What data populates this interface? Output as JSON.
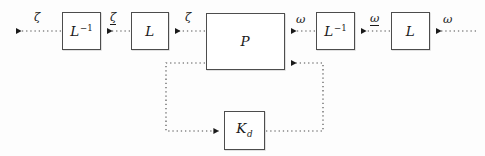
{
  "diagram": {
    "type": "control-block-diagram",
    "background_color": "#fdfdfd",
    "line_color": "#4d4d4d",
    "line_style": "dotted",
    "blocks": [
      {
        "id": "l-inv-left",
        "label_base": "L",
        "label_sup": "−1",
        "label_sub": "",
        "x": 62,
        "y": 12,
        "w": 39,
        "h": 38
      },
      {
        "id": "l-left",
        "label_base": "L",
        "label_sup": "",
        "label_sub": "",
        "x": 131,
        "y": 12,
        "w": 38,
        "h": 38
      },
      {
        "id": "plant",
        "label_base": "P",
        "label_sup": "",
        "label_sub": "",
        "x": 206,
        "y": 13,
        "w": 79,
        "h": 57
      },
      {
        "id": "l-inv-right",
        "label_base": "L",
        "label_sup": "−1",
        "label_sub": "",
        "x": 316,
        "y": 12,
        "w": 39,
        "h": 38
      },
      {
        "id": "l-right",
        "label_base": "L",
        "label_sup": "",
        "label_sub": "",
        "x": 391,
        "y": 12,
        "w": 39,
        "h": 38
      },
      {
        "id": "controller",
        "label_base": "K",
        "label_sup": "",
        "label_sub": "d",
        "x": 224,
        "y": 111,
        "w": 41,
        "h": 39
      }
    ],
    "signals": [
      {
        "id": "zeta-out",
        "text": "ζ",
        "underbar": false,
        "x": 34,
        "y": 12
      },
      {
        "id": "zeta-mid",
        "text": "ζ",
        "underbar": true,
        "x": 110,
        "y": 12
      },
      {
        "id": "zeta-in",
        "text": "ζ",
        "underbar": false,
        "x": 185,
        "y": 12
      },
      {
        "id": "omega-out",
        "text": "ω",
        "underbar": false,
        "x": 296,
        "y": 13
      },
      {
        "id": "omega-mid",
        "text": "ω",
        "underbar": true,
        "x": 370,
        "y": 12
      },
      {
        "id": "omega-in",
        "text": "ω",
        "underbar": false,
        "x": 443,
        "y": 13
      }
    ],
    "connections": [
      {
        "id": "conn-plant-to-l-left",
        "from": "plant",
        "to": "l-left",
        "label": "ζ"
      },
      {
        "id": "conn-l-left-to-l-inv-left",
        "from": "l-left",
        "to": "l-inv-left",
        "label": "ζ"
      },
      {
        "id": "conn-l-inv-left-to-exterior",
        "from": "l-inv-left",
        "to": "exterior",
        "label": "ζ"
      },
      {
        "id": "conn-exterior-to-l-right",
        "from": "exterior",
        "to": "l-right",
        "label": "ω"
      },
      {
        "id": "conn-l-right-to-l-inv-right",
        "from": "l-right",
        "to": "l-inv-right",
        "label": "ω"
      },
      {
        "id": "conn-l-inv-right-to-plant",
        "from": "l-inv-right",
        "to": "plant",
        "label": "ω"
      },
      {
        "id": "conn-plant-to-controller",
        "from": "plant",
        "to": "controller",
        "label": ""
      },
      {
        "id": "conn-controller-to-plant",
        "from": "controller",
        "to": "plant",
        "label": ""
      }
    ]
  }
}
